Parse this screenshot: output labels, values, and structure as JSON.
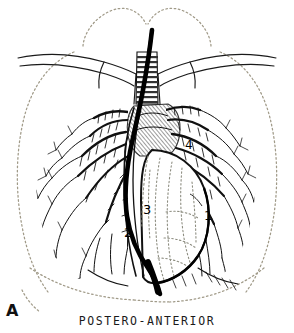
{
  "figure": {
    "panel_letter": "A",
    "caption": "POSTERO-ANTERIOR",
    "view": "postero-anterior chest radiograph diagram",
    "background_color": "#ffffff",
    "ink_color": "#000000",
    "outline_color": "#9a9a8c"
  },
  "labels": [
    {
      "id": "1",
      "text": "1",
      "region": "left-cardiac-border"
    },
    {
      "id": "2",
      "text": "2",
      "region": "right-cardiac-border"
    },
    {
      "id": "3",
      "text": "3",
      "region": "right-atrium-catheter"
    },
    {
      "id": "4",
      "text": "4",
      "region": "left-hilum"
    }
  ],
  "structures": {
    "chest_wall": "dotted thorax outline",
    "lung_apices": "dotted apical domes",
    "clavicles": "paired solid clavicle outlines",
    "trachea": "banded cartilage-ring trachea",
    "catheter": "thick black cardiac catheter",
    "bronchial_tree_right": "branching striped bronchi",
    "bronchial_tree_left": "branching striped bronchi",
    "heart": "cardiac silhouette with dotted coronary markings",
    "diaphragm": "dotted diaphragm curve",
    "aortic_arch": "cross-hatched mediastinal shading"
  }
}
